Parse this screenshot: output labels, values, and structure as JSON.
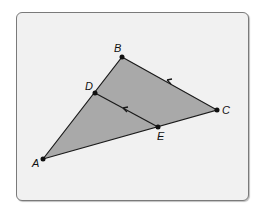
{
  "figure": {
    "fill_color": "#a9a9a9",
    "line_color": "#1a1a1a",
    "points": {
      "A": {
        "label": "A",
        "x": 43,
        "y": 159
      },
      "B": {
        "label": "B",
        "x": 122,
        "y": 57
      },
      "C": {
        "label": "C",
        "x": 217,
        "y": 110
      },
      "D": {
        "label": "D",
        "x": 95,
        "y": 93
      },
      "E": {
        "label": "E",
        "x": 158,
        "y": 127
      }
    },
    "segments": [
      "AB",
      "BC",
      "CA",
      "DE"
    ],
    "parallel_marks": [
      "BC",
      "DE"
    ]
  }
}
